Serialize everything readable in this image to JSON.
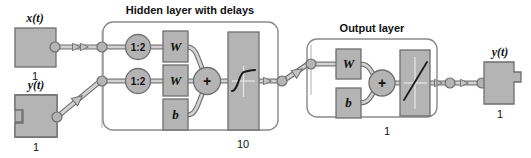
{
  "diagram": {
    "title_text": "Neural network block diagram",
    "colors": {
      "block_fill": "#b4b4b4",
      "block_stroke": "#6e6e6e",
      "group_stroke": "#8a8a8a",
      "wire": "#9a9a9a",
      "wire_edge": "#6e6e6e",
      "text": "#111111",
      "background": "#ffffff"
    }
  },
  "inputs": [
    {
      "id": "input-x",
      "label": "x(t)",
      "size": "1",
      "shape": "plain-block"
    },
    {
      "id": "input-y",
      "label": "y(t)",
      "size": "1",
      "shape": "notched-block"
    }
  ],
  "layers": [
    {
      "id": "hidden-layer",
      "title": "Hidden layer with delays",
      "size": "10",
      "delays": [
        {
          "label": "1:2"
        },
        {
          "label": "1:2"
        }
      ],
      "weights": [
        {
          "label": "W"
        },
        {
          "label": "W"
        }
      ],
      "bias": {
        "label": "b"
      },
      "sum": {
        "label": "+"
      },
      "transfer": {
        "name": "sigmoid-transfer-function",
        "label": ""
      }
    },
    {
      "id": "output-layer",
      "title": "Output layer",
      "size": "1",
      "weights": [
        {
          "label": "W"
        }
      ],
      "bias": {
        "label": "b"
      },
      "sum": {
        "label": "+"
      },
      "transfer": {
        "name": "linear-transfer-function",
        "label": ""
      }
    }
  ],
  "outputs": [
    {
      "id": "output-y",
      "label": "y(t)",
      "size": "1",
      "shape": "tabbed-block"
    }
  ]
}
